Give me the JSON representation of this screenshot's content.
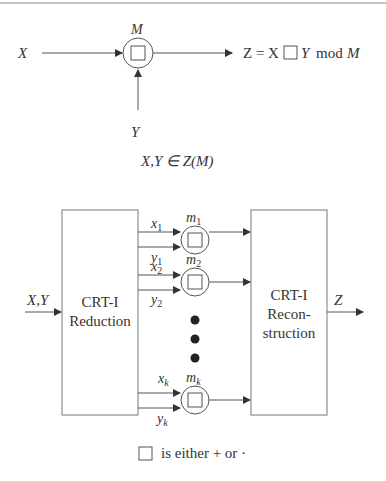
{
  "top_diagram": {
    "input_x": "X",
    "input_y": "Y",
    "modulus": "M",
    "output_expr": {
      "lhs": "Z = X",
      "middle": "Y",
      "mod": "mod",
      "modulus": "M"
    },
    "domain_note": "X,Y ∈ Z(M)"
  },
  "bottom_diagram": {
    "input_label": "X,Y",
    "reduction_block": {
      "line1": "CRT-I",
      "line2": "Reduction"
    },
    "reconstruction_block": {
      "line1": "CRT-I",
      "line2": "Recon-",
      "line3": "struction"
    },
    "output_label": "Z",
    "channels": [
      {
        "x": "x",
        "y": "y",
        "m": "m",
        "sub": "1"
      },
      {
        "x": "x",
        "y": "y",
        "m": "m",
        "sub": "2"
      },
      {
        "x": "x",
        "y": "y",
        "m": "m",
        "sub": "k"
      }
    ]
  },
  "legend": "is either + or ·",
  "colors": {
    "stroke": "#555555",
    "text": "#333333"
  }
}
